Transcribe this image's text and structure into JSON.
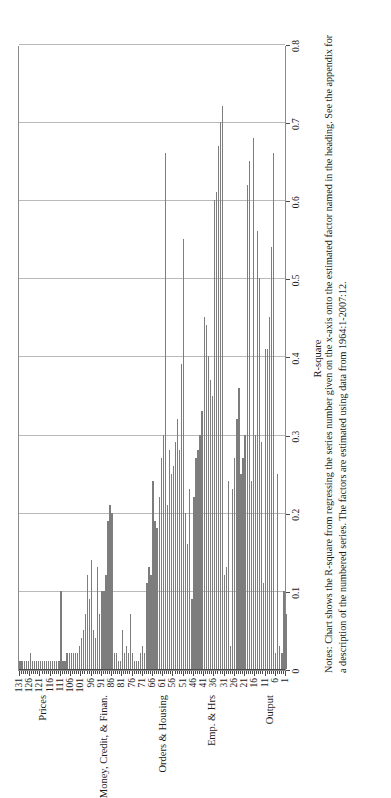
{
  "chart_data": {
    "type": "bar",
    "orientation": "horizontal",
    "title": "",
    "xlabel": "",
    "ylabel": "R-square",
    "ylim": [
      0,
      0.8
    ],
    "ytick_labels": [
      "0",
      "0.1",
      "0.2",
      "0.3",
      "0.4",
      "0.5",
      "0.6",
      "0.7",
      "0.8"
    ],
    "ytick_values": [
      0,
      0.1,
      0.2,
      0.3,
      0.4,
      0.5,
      0.6,
      0.7,
      0.8
    ],
    "grid": "vertical gridlines at each 0.1 of R-square",
    "legend": "none",
    "xtick_labels": [
      "1",
      "6",
      "11",
      "16",
      "21",
      "26",
      "31",
      "36",
      "41",
      "46",
      "51",
      "56",
      "61",
      "66",
      "71",
      "76",
      "81",
      "86",
      "91",
      "96",
      "101",
      "106",
      "111",
      "116",
      "121",
      "126",
      "131"
    ],
    "xtick_values": [
      1,
      6,
      11,
      16,
      21,
      26,
      31,
      36,
      41,
      46,
      51,
      56,
      61,
      66,
      71,
      76,
      81,
      86,
      91,
      96,
      101,
      106,
      111,
      116,
      121,
      126,
      131
    ],
    "group_labels": [
      {
        "label": "Output",
        "center": 9
      },
      {
        "label": "Emp. & Hrs",
        "center": 37
      },
      {
        "label": "Orders & Housing",
        "center": 61
      },
      {
        "label": "Money, Credit, & Finan.",
        "center": 90
      },
      {
        "label": "Prices",
        "center": 120
      }
    ],
    "categories": [
      1,
      2,
      3,
      4,
      5,
      6,
      7,
      8,
      9,
      10,
      11,
      12,
      13,
      14,
      15,
      16,
      17,
      18,
      19,
      20,
      21,
      22,
      23,
      24,
      25,
      26,
      27,
      28,
      29,
      30,
      31,
      32,
      33,
      34,
      35,
      36,
      37,
      38,
      39,
      40,
      41,
      42,
      43,
      44,
      45,
      46,
      47,
      48,
      49,
      50,
      51,
      52,
      53,
      54,
      55,
      56,
      57,
      58,
      59,
      60,
      61,
      62,
      63,
      64,
      65,
      66,
      67,
      68,
      69,
      70,
      71,
      72,
      73,
      74,
      75,
      76,
      77,
      78,
      79,
      80,
      81,
      82,
      83,
      84,
      85,
      86,
      87,
      88,
      89,
      90,
      91,
      92,
      93,
      94,
      95,
      96,
      97,
      98,
      99,
      100,
      101,
      102,
      103,
      104,
      105,
      106,
      107,
      108,
      109,
      110,
      111,
      112,
      113,
      114,
      115,
      116,
      117,
      118,
      119,
      120,
      121,
      122,
      123,
      124,
      125,
      126,
      127,
      128,
      129,
      130,
      131
    ],
    "values": [
      0.07,
      0.1,
      0.02,
      0.03,
      0.25,
      0.02,
      0.66,
      0.54,
      0.45,
      0.41,
      0.41,
      0.11,
      0.29,
      0.5,
      0.56,
      0.3,
      0.68,
      0.24,
      0.65,
      0.62,
      0.3,
      0.27,
      0.25,
      0.36,
      0.32,
      0.27,
      0.23,
      0.03,
      0.24,
      0.13,
      0.12,
      0.72,
      0.7,
      0.67,
      0.61,
      0.6,
      0.35,
      0.37,
      0.4,
      0.44,
      0.45,
      0.33,
      0.3,
      0.28,
      0.27,
      0.22,
      0.09,
      0.23,
      0.16,
      0.2,
      0.55,
      0.39,
      0.28,
      0.32,
      0.29,
      0.26,
      0.25,
      0.28,
      0.21,
      0.66,
      0.3,
      0.27,
      0.22,
      0.18,
      0.19,
      0.24,
      0.12,
      0.13,
      0.11,
      0.02,
      0.03,
      0.02,
      0.01,
      0.01,
      0.01,
      0.02,
      0.07,
      0.02,
      0.03,
      0.02,
      0.05,
      0.01,
      0.01,
      0.02,
      0.02,
      0.2,
      0.21,
      0.19,
      0.12,
      0.1,
      0.1,
      0.07,
      0.13,
      0.04,
      0.05,
      0.14,
      0.09,
      0.12,
      0.07,
      0.05,
      0.04,
      0.03,
      0.02,
      0.02,
      0.02,
      0.02,
      0.02,
      0.02,
      0.01,
      0.01,
      0.1,
      0.01,
      0.01,
      0.01,
      0.01,
      0.01,
      0.01,
      0.01,
      0.01,
      0.01,
      0.01,
      0.01,
      0.01,
      0.01,
      0.01,
      0.02,
      0.01,
      0.01,
      0.01,
      0.01,
      0.01
    ],
    "bar_color": "#7d7d7d",
    "plot_background": "#ffffff",
    "axis_color": "#4a4a4a",
    "grid_color": "#b9b9b9"
  },
  "notes": {
    "text": "Notes: Chart shows the R-square from regressing the series number given on the x-axis onto the estimated factor named in the heading. See the appendix for a description of the numbered series. The factors are estimated using data from 1964:1-2007:12."
  }
}
